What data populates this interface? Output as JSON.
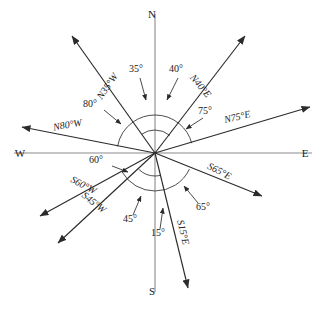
{
  "diagram": {
    "type": "compass-rose",
    "center": {
      "x": 155,
      "y": 153
    },
    "cardinals": {
      "north": "N",
      "south": "S",
      "east": "E",
      "west": "W"
    },
    "cardinal_positions": {
      "north": {
        "x": 152,
        "y": 18
      },
      "south": {
        "x": 152,
        "y": 295
      },
      "east": {
        "x": 305,
        "y": 157
      },
      "west": {
        "x": 20,
        "y": 157
      }
    },
    "rays": [
      {
        "id": "n35w",
        "bearing_label": "N35°W",
        "angle_label": "35°",
        "from_cardinal": "N",
        "toward_cardinal": "W",
        "degrees": 35,
        "tip": {
          "x": 72,
          "y": 36
        },
        "bearing_label_pos": {
          "x": 110,
          "y": 88
        },
        "bearing_label_rotation": -55,
        "angle_label_pos": {
          "x": 136,
          "y": 72
        },
        "leader": {
          "x1": 140,
          "y1": 78,
          "x2": 146,
          "y2": 100
        }
      },
      {
        "id": "n40e",
        "bearing_label": "N40°E",
        "angle_label": "40°",
        "from_cardinal": "N",
        "toward_cardinal": "E",
        "degrees": 40,
        "tip": {
          "x": 245,
          "y": 36
        },
        "bearing_label_pos": {
          "x": 198,
          "y": 88
        },
        "bearing_label_rotation": 50,
        "angle_label_pos": {
          "x": 176,
          "y": 72
        },
        "leader": {
          "x1": 178,
          "y1": 78,
          "x2": 167,
          "y2": 100
        }
      },
      {
        "id": "n80w",
        "bearing_label": "N80°W",
        "angle_label": "80°",
        "from_cardinal": "N",
        "toward_cardinal": "W",
        "degrees": 80,
        "tip": {
          "x": 22,
          "y": 127
        },
        "bearing_label_pos": {
          "x": 68,
          "y": 128
        },
        "bearing_label_rotation": -10,
        "angle_label_pos": {
          "x": 90,
          "y": 107
        },
        "leader": {
          "x1": 104,
          "y1": 110,
          "x2": 121,
          "y2": 124
        }
      },
      {
        "id": "n75e",
        "bearing_label": "N75°E",
        "angle_label": "75°",
        "from_cardinal": "N",
        "toward_cardinal": "E",
        "degrees": 75,
        "tip": {
          "x": 310,
          "y": 107
        },
        "bearing_label_pos": {
          "x": 238,
          "y": 120
        },
        "bearing_label_rotation": -13,
        "angle_label_pos": {
          "x": 205,
          "y": 114
        },
        "leader": {
          "x1": 203,
          "y1": 118,
          "x2": 186,
          "y2": 129
        }
      },
      {
        "id": "s60w",
        "bearing_label": "S60°W",
        "angle_label": "60°",
        "from_cardinal": "S",
        "toward_cardinal": "W",
        "degrees": 60,
        "tip": {
          "x": 40,
          "y": 216
        },
        "bearing_label_pos": {
          "x": 82,
          "y": 188
        },
        "bearing_label_rotation": 28,
        "angle_label_pos": {
          "x": 96,
          "y": 163
        },
        "leader": {
          "x1": 112,
          "y1": 166,
          "x2": 128,
          "y2": 172
        }
      },
      {
        "id": "s45w",
        "bearing_label": "S45°W",
        "angle_label": "45°",
        "from_cardinal": "S",
        "toward_cardinal": "W",
        "degrees": 45,
        "tip": {
          "x": 58,
          "y": 243
        },
        "bearing_label_pos": {
          "x": 92,
          "y": 205
        },
        "bearing_label_rotation": 38,
        "angle_label_pos": {
          "x": 130,
          "y": 222
        },
        "leader": {
          "x1": 133,
          "y1": 215,
          "x2": 141,
          "y2": 196
        }
      },
      {
        "id": "s65e",
        "bearing_label": "S65°E",
        "angle_label": "65°",
        "from_cardinal": "S",
        "toward_cardinal": "E",
        "degrees": 65,
        "tip": {
          "x": 262,
          "y": 196
        },
        "bearing_label_pos": {
          "x": 218,
          "y": 174
        },
        "bearing_label_rotation": 27,
        "angle_label_pos": {
          "x": 203,
          "y": 210
        },
        "leader": {
          "x1": 198,
          "y1": 203,
          "x2": 184,
          "y2": 186
        }
      },
      {
        "id": "s15e",
        "bearing_label": "S15°E",
        "angle_label": "15°",
        "from_cardinal": "S",
        "toward_cardinal": "E",
        "degrees": 15,
        "tip": {
          "x": 188,
          "y": 288
        },
        "bearing_label_pos": {
          "x": 180,
          "y": 233
        },
        "bearing_label_rotation": 76,
        "angle_label_pos": {
          "x": 158,
          "y": 236
        },
        "leader": {
          "x1": 160,
          "y1": 229,
          "x2": 163,
          "y2": 208
        }
      }
    ],
    "arcs": [
      {
        "id": "arc-nw-outer",
        "radius": 38,
        "start_deg": 90,
        "end_deg": 125
      },
      {
        "id": "arc-ne-outer",
        "radius": 38,
        "start_deg": 50,
        "end_deg": 90
      },
      {
        "id": "arc-nw-inner",
        "radius": 23,
        "start_deg": 90,
        "end_deg": 125
      },
      {
        "id": "arc-ne-inner",
        "radius": 23,
        "start_deg": 50,
        "end_deg": 90
      },
      {
        "id": "arc-w-outer",
        "radius": 38,
        "start_deg": 125,
        "end_deg": 170
      },
      {
        "id": "arc-e-outer",
        "radius": 38,
        "start_deg": 15,
        "end_deg": 50
      },
      {
        "id": "arc-sw-outer",
        "radius": 38,
        "start_deg": 210,
        "end_deg": 270
      },
      {
        "id": "arc-se-outer",
        "radius": 38,
        "start_deg": 270,
        "end_deg": 335
      },
      {
        "id": "arc-sw-inner",
        "radius": 23,
        "start_deg": 225,
        "end_deg": 270
      },
      {
        "id": "arc-se-inner",
        "radius": 23,
        "start_deg": 270,
        "end_deg": 285
      }
    ],
    "colors": {
      "axis": "#8a8a8a",
      "ray": "#2b2b2b",
      "arc": "#3a3a3a",
      "text": "#1a1a1a",
      "background": "#ffffff"
    }
  }
}
